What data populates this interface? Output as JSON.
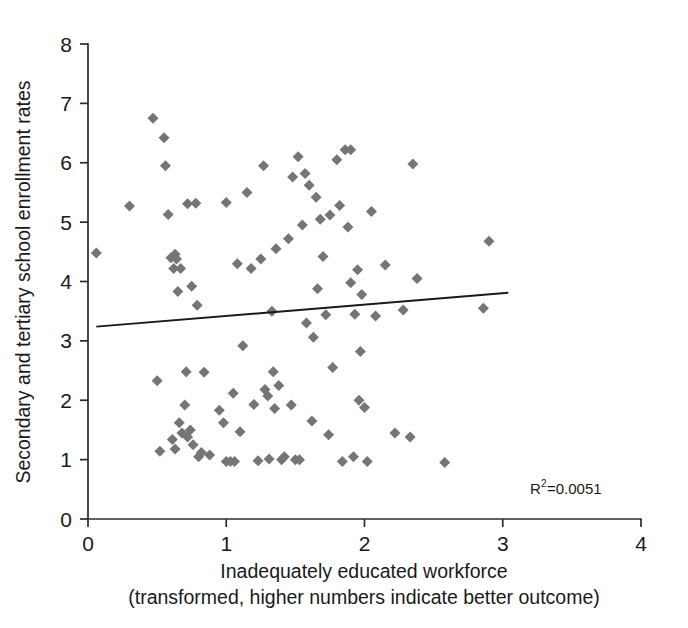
{
  "chart_data": {
    "type": "scatter",
    "title": "",
    "xlabel": "Inadequately educated workforce",
    "xlabel_line2": "(transformed, higher numbers indicate better outcome)",
    "ylabel": "Secondary and tertiary school enrollment rates",
    "xlim": [
      0,
      4
    ],
    "ylim": [
      0,
      8
    ],
    "xticks": [
      0,
      1,
      2,
      3,
      4
    ],
    "yticks": [
      0,
      1,
      2,
      3,
      4,
      5,
      6,
      7,
      8
    ],
    "xtick_labels": [
      "0",
      "1",
      "2",
      "3",
      "4"
    ],
    "ytick_labels": [
      "0",
      "1",
      "2",
      "3",
      "4",
      "5",
      "6",
      "7",
      "8"
    ],
    "grid": false,
    "legend": "none",
    "marker_shape": "diamond",
    "marker_color": "#757575",
    "marker_size": 11,
    "annotation": {
      "r_squared_label": "R",
      "r_squared_exponent": "2",
      "r_squared_value": "=0.0051",
      "full_text": "R2=0.0051",
      "x": 2.55,
      "y": 0.62
    },
    "trendline": {
      "color": "#1a1a1a",
      "x": [
        0.06,
        3.04
      ],
      "y": [
        3.24,
        3.81
      ]
    },
    "points": [
      [
        0.06,
        4.48
      ],
      [
        0.3,
        5.27
      ],
      [
        0.47,
        6.75
      ],
      [
        0.5,
        2.33
      ],
      [
        0.52,
        1.14
      ],
      [
        0.55,
        6.42
      ],
      [
        0.56,
        5.95
      ],
      [
        0.58,
        5.13
      ],
      [
        0.6,
        4.4
      ],
      [
        0.61,
        1.34
      ],
      [
        0.62,
        4.22
      ],
      [
        0.63,
        4.46
      ],
      [
        0.63,
        1.18
      ],
      [
        0.64,
        4.38
      ],
      [
        0.65,
        3.83
      ],
      [
        0.66,
        1.62
      ],
      [
        0.67,
        4.22
      ],
      [
        0.68,
        1.45
      ],
      [
        0.7,
        1.92
      ],
      [
        0.71,
        2.48
      ],
      [
        0.72,
        5.31
      ],
      [
        0.72,
        1.38
      ],
      [
        0.74,
        1.5
      ],
      [
        0.75,
        3.92
      ],
      [
        0.76,
        1.25
      ],
      [
        0.78,
        5.32
      ],
      [
        0.79,
        3.6
      ],
      [
        0.8,
        1.05
      ],
      [
        0.82,
        1.12
      ],
      [
        0.84,
        2.47
      ],
      [
        0.88,
        1.08
      ],
      [
        0.95,
        1.83
      ],
      [
        0.98,
        1.62
      ],
      [
        1.0,
        5.33
      ],
      [
        1.0,
        0.97
      ],
      [
        1.03,
        0.97
      ],
      [
        1.05,
        2.12
      ],
      [
        1.06,
        0.97
      ],
      [
        1.08,
        4.3
      ],
      [
        1.1,
        1.47
      ],
      [
        1.12,
        2.92
      ],
      [
        1.15,
        5.5
      ],
      [
        1.18,
        4.22
      ],
      [
        1.2,
        1.93
      ],
      [
        1.23,
        0.98
      ],
      [
        1.25,
        4.38
      ],
      [
        1.27,
        5.95
      ],
      [
        1.28,
        2.18
      ],
      [
        1.3,
        2.07
      ],
      [
        1.31,
        1.01
      ],
      [
        1.33,
        3.5
      ],
      [
        1.34,
        2.48
      ],
      [
        1.35,
        1.86
      ],
      [
        1.36,
        4.55
      ],
      [
        1.38,
        2.25
      ],
      [
        1.4,
        1.0
      ],
      [
        1.42,
        1.05
      ],
      [
        1.45,
        4.72
      ],
      [
        1.47,
        1.92
      ],
      [
        1.48,
        5.76
      ],
      [
        1.5,
        1.0
      ],
      [
        1.52,
        6.1
      ],
      [
        1.53,
        1.0
      ],
      [
        1.55,
        4.95
      ],
      [
        1.57,
        5.82
      ],
      [
        1.58,
        3.3
      ],
      [
        1.6,
        5.62
      ],
      [
        1.62,
        1.65
      ],
      [
        1.63,
        3.06
      ],
      [
        1.65,
        5.42
      ],
      [
        1.66,
        3.88
      ],
      [
        1.68,
        5.05
      ],
      [
        1.7,
        4.42
      ],
      [
        1.72,
        3.44
      ],
      [
        1.74,
        1.42
      ],
      [
        1.75,
        5.12
      ],
      [
        1.77,
        2.55
      ],
      [
        1.8,
        6.05
      ],
      [
        1.82,
        5.28
      ],
      [
        1.84,
        0.97
      ],
      [
        1.86,
        6.22
      ],
      [
        1.88,
        4.92
      ],
      [
        1.9,
        6.22
      ],
      [
        1.9,
        3.98
      ],
      [
        1.92,
        1.05
      ],
      [
        1.93,
        3.45
      ],
      [
        1.95,
        4.2
      ],
      [
        1.96,
        2.0
      ],
      [
        1.97,
        2.82
      ],
      [
        1.98,
        3.78
      ],
      [
        2.0,
        1.88
      ],
      [
        2.02,
        0.97
      ],
      [
        2.05,
        5.18
      ],
      [
        2.08,
        3.42
      ],
      [
        2.15,
        4.28
      ],
      [
        2.22,
        1.45
      ],
      [
        2.28,
        3.52
      ],
      [
        2.33,
        1.38
      ],
      [
        2.35,
        5.98
      ],
      [
        2.38,
        4.05
      ],
      [
        2.58,
        0.95
      ],
      [
        2.86,
        3.55
      ],
      [
        2.9,
        4.68
      ]
    ]
  },
  "geometry": {
    "plot_left": 88,
    "plot_right": 641,
    "plot_top": 44,
    "plot_bottom": 519
  }
}
